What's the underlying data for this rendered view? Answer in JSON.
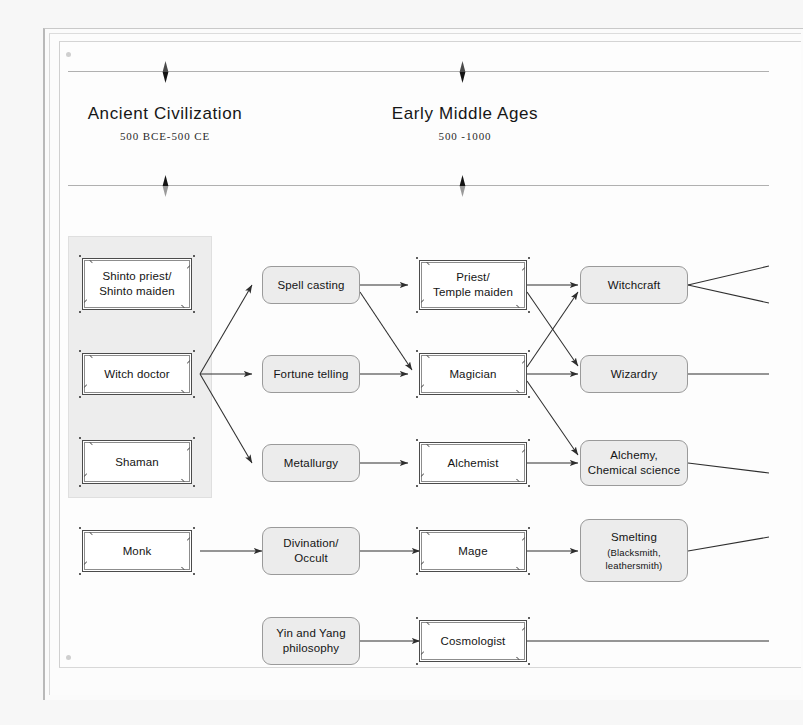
{
  "page": {
    "background": "#f7f7f7",
    "canvas_background": "#fdfdfd",
    "line_color": "#3a3a3a",
    "group_panel_color": "#ededed",
    "node_gray_fill": "#ececec",
    "node_white_fill": "#ffffff"
  },
  "eras": [
    {
      "name": "Ancient Civilization",
      "range": "500 BCE-500 CE"
    },
    {
      "name": "Early Middle Ages",
      "range": "500 -1000"
    }
  ],
  "diagram": {
    "type": "flow-diagram",
    "title": "",
    "columns": [
      {
        "id": "col1",
        "style": "white-double-border",
        "grouped": true,
        "nodes": [
          {
            "id": "shinto",
            "label": "Shinto priest/\nShinto maiden"
          },
          {
            "id": "witchdoctor",
            "label": "Witch doctor"
          },
          {
            "id": "shaman",
            "label": "Shaman"
          },
          {
            "id": "monk",
            "label": "Monk"
          }
        ]
      },
      {
        "id": "col2",
        "style": "gray-rounded",
        "grouped": false,
        "nodes": [
          {
            "id": "spellcasting",
            "label": "Spell casting"
          },
          {
            "id": "fortunetelling",
            "label": "Fortune telling"
          },
          {
            "id": "metallurgy",
            "label": "Metallurgy"
          },
          {
            "id": "divination",
            "label": "Divination/\nOccult"
          },
          {
            "id": "yinyang",
            "label": "Yin and Yang\nphilosophy"
          }
        ]
      },
      {
        "id": "col3",
        "style": "white-double-border",
        "grouped": false,
        "nodes": [
          {
            "id": "priest",
            "label": "Priest/\nTemple maiden"
          },
          {
            "id": "magician",
            "label": "Magician"
          },
          {
            "id": "alchemist",
            "label": "Alchemist"
          },
          {
            "id": "mage",
            "label": "Mage"
          },
          {
            "id": "cosmologist",
            "label": "Cosmologist"
          }
        ]
      },
      {
        "id": "col4",
        "style": "gray-rounded",
        "grouped": false,
        "nodes": [
          {
            "id": "witchcraft",
            "label": "Witchcraft"
          },
          {
            "id": "wizardry",
            "label": "Wizardry"
          },
          {
            "id": "alchemy",
            "label": "Alchemy,\nChemical science"
          },
          {
            "id": "smelting",
            "label": "Smelting",
            "sublabel": "(Blacksmith,\nleathersmith)"
          }
        ]
      }
    ],
    "edges": [
      {
        "from": "witchdoctor",
        "to": "spellcasting"
      },
      {
        "from": "witchdoctor",
        "to": "fortunetelling"
      },
      {
        "from": "witchdoctor",
        "to": "metallurgy"
      },
      {
        "from": "spellcasting",
        "to": "priest"
      },
      {
        "from": "spellcasting",
        "to": "magician"
      },
      {
        "from": "fortunetelling",
        "to": "magician"
      },
      {
        "from": "metallurgy",
        "to": "alchemist"
      },
      {
        "from": "priest",
        "to": "witchcraft"
      },
      {
        "from": "priest",
        "to": "wizardry"
      },
      {
        "from": "magician",
        "to": "witchcraft"
      },
      {
        "from": "magician",
        "to": "wizardry"
      },
      {
        "from": "magician",
        "to": "alchemy"
      },
      {
        "from": "alchemist",
        "to": "alchemy"
      },
      {
        "from": "monk",
        "to": "divination"
      },
      {
        "from": "divination",
        "to": "mage"
      },
      {
        "from": "mage",
        "to": "smelting"
      },
      {
        "from": "yinyang",
        "to": "cosmologist"
      },
      {
        "from": "witchcraft",
        "to": "offscreen-upper"
      },
      {
        "from": "witchcraft",
        "to": "offscreen-lower"
      },
      {
        "from": "wizardry",
        "to": "offscreen"
      },
      {
        "from": "alchemy",
        "to": "offscreen"
      },
      {
        "from": "smelting",
        "to": "offscreen"
      },
      {
        "from": "cosmologist",
        "to": "offscreen"
      }
    ]
  }
}
